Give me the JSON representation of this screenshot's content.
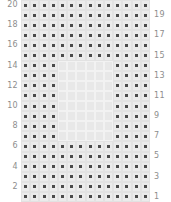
{
  "figure": {
    "type": "pin-grid",
    "rows": 20,
    "columns": 14,
    "panel_color": "#e2e2e2",
    "hollow_color": "#e8e8e8",
    "pin_color": "#4a4a4a",
    "pad_color": "#ebebeb",
    "label_color": "#8d8d8d"
  },
  "left_labels": [
    "20",
    "",
    "18",
    "",
    "16",
    "",
    "14",
    "",
    "12",
    "",
    "10",
    "",
    "8",
    "",
    "6",
    "",
    "4",
    "",
    "2",
    ""
  ],
  "right_labels": [
    "",
    "19",
    "",
    "17",
    "",
    "15",
    "",
    "13",
    "",
    "11",
    "",
    "9",
    "",
    "7",
    "",
    "5",
    "",
    "3",
    "",
    "1"
  ],
  "grid": {
    "hollow_region": {
      "row_start": 7,
      "row_end": 14,
      "column_start": 5,
      "column_end": 10
    },
    "rows": [
      [
        1,
        1,
        1,
        1,
        1,
        1,
        1,
        1,
        1,
        1,
        1,
        1,
        1,
        1
      ],
      [
        1,
        1,
        1,
        1,
        1,
        1,
        1,
        1,
        1,
        1,
        1,
        1,
        1,
        1
      ],
      [
        1,
        1,
        1,
        1,
        1,
        1,
        1,
        1,
        1,
        1,
        1,
        1,
        1,
        1
      ],
      [
        1,
        1,
        1,
        1,
        1,
        1,
        1,
        1,
        1,
        1,
        1,
        1,
        1,
        1
      ],
      [
        1,
        1,
        1,
        1,
        1,
        1,
        1,
        1,
        1,
        1,
        1,
        1,
        1,
        1
      ],
      [
        1,
        1,
        1,
        1,
        1,
        1,
        1,
        1,
        1,
        1,
        1,
        1,
        1,
        1
      ],
      [
        1,
        1,
        1,
        1,
        0,
        0,
        0,
        0,
        0,
        0,
        1,
        1,
        1,
        1
      ],
      [
        1,
        1,
        1,
        1,
        0,
        0,
        0,
        0,
        0,
        0,
        1,
        1,
        1,
        1
      ],
      [
        1,
        1,
        1,
        1,
        0,
        0,
        0,
        0,
        0,
        0,
        1,
        1,
        1,
        1
      ],
      [
        1,
        1,
        1,
        1,
        0,
        0,
        0,
        0,
        0,
        0,
        1,
        1,
        1,
        1
      ],
      [
        1,
        1,
        1,
        1,
        0,
        0,
        0,
        0,
        0,
        0,
        1,
        1,
        1,
        1
      ],
      [
        1,
        1,
        1,
        1,
        0,
        0,
        0,
        0,
        0,
        0,
        1,
        1,
        1,
        1
      ],
      [
        1,
        1,
        1,
        1,
        0,
        0,
        0,
        0,
        0,
        0,
        1,
        1,
        1,
        1
      ],
      [
        1,
        1,
        1,
        1,
        0,
        0,
        0,
        0,
        0,
        0,
        1,
        1,
        1,
        1
      ],
      [
        1,
        1,
        1,
        1,
        1,
        1,
        1,
        1,
        1,
        1,
        1,
        1,
        1,
        1
      ],
      [
        1,
        1,
        1,
        1,
        1,
        1,
        1,
        1,
        1,
        1,
        1,
        1,
        1,
        1
      ],
      [
        1,
        1,
        1,
        1,
        1,
        1,
        1,
        1,
        1,
        1,
        1,
        1,
        1,
        1
      ],
      [
        1,
        1,
        1,
        1,
        1,
        1,
        1,
        1,
        1,
        1,
        1,
        1,
        1,
        1
      ],
      [
        1,
        1,
        1,
        1,
        1,
        1,
        1,
        1,
        1,
        1,
        1,
        1,
        1,
        1
      ],
      [
        1,
        1,
        1,
        1,
        1,
        1,
        1,
        1,
        1,
        1,
        1,
        1,
        1,
        1
      ]
    ]
  }
}
